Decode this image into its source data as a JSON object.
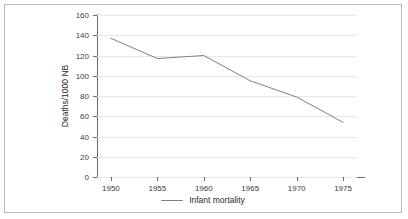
{
  "chart_data": {
    "type": "line",
    "title": "",
    "xlabel": "",
    "ylabel": "Deaths/1000 NB",
    "x": [
      1950,
      1955,
      1960,
      1965,
      1970,
      1975
    ],
    "xtick_labels": [
      "1950",
      "1955",
      "1960",
      "1965",
      "1970",
      "1975"
    ],
    "ytick_labels": [
      "0",
      "20",
      "40",
      "60",
      "80",
      "100",
      "120",
      "140",
      "160"
    ],
    "yticks": [
      0,
      20,
      40,
      60,
      80,
      100,
      120,
      140,
      160
    ],
    "ylim": [
      0,
      160
    ],
    "xlim": [
      1948.5,
      1976.5
    ],
    "grid": "horizontal",
    "legend_position": "bottom-center",
    "series": [
      {
        "name": "Infant mortality",
        "color": "#808080",
        "values": [
          137,
          117,
          120,
          95,
          79,
          54
        ]
      }
    ]
  },
  "legend": {
    "items": [
      {
        "label": "Infant mortality",
        "swatch": "line-swatch"
      }
    ]
  },
  "figure": {
    "border_color": "#b9b9b9",
    "background": "#ffffff",
    "axis_color": "#6a6a6a",
    "grid_color": "#e8e8e8",
    "text_color": "#2b2b2b"
  }
}
